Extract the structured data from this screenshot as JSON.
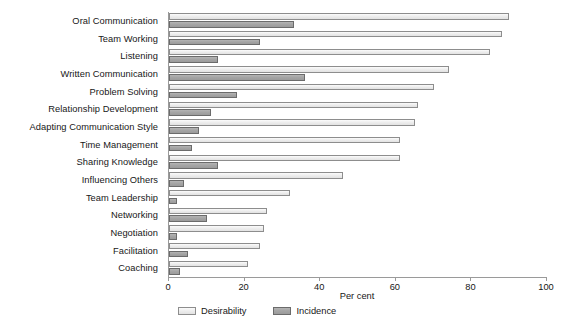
{
  "chart_data": {
    "type": "bar",
    "orientation": "horizontal",
    "title": "",
    "subtitle": "",
    "xlabel": "Per cent",
    "ylabel": "",
    "xlim": [
      0,
      100
    ],
    "xticks": [
      0,
      20,
      40,
      60,
      80,
      100
    ],
    "xtick_labels": [
      "0",
      "20",
      "40",
      "60",
      "80",
      "100"
    ],
    "grid": false,
    "legend_position": "bottom-left",
    "categories": [
      "Oral Communication",
      "Team Working",
      "Listening",
      "Written Communication",
      "Problem Solving",
      "Relationship Development",
      "Adapting Communication Style",
      "Time Management",
      "Sharing Knowledge",
      "Influencing Others",
      "Team Leadership",
      "Networking",
      "Negotiation",
      "Facilitation",
      "Coaching"
    ],
    "series": [
      {
        "name": "Desirability",
        "color": "#ededed",
        "values": [
          90,
          88,
          85,
          74,
          70,
          66,
          65,
          61,
          61,
          46,
          32,
          26,
          25,
          24,
          21
        ]
      },
      {
        "name": "Incidence",
        "color": "#a5a5a5",
        "values": [
          33,
          24,
          13,
          36,
          18,
          11,
          8,
          6,
          13,
          4,
          2,
          10,
          2,
          5,
          3
        ]
      }
    ]
  },
  "legend": {
    "items": [
      {
        "label": "Desirability",
        "swatch": "desirability"
      },
      {
        "label": "Incidence",
        "swatch": "incidence"
      }
    ]
  }
}
